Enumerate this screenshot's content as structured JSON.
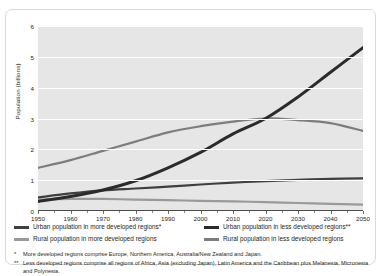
{
  "chart_data": {
    "type": "line",
    "title": "",
    "xlabel": "",
    "ylabel": "Population (billions)",
    "xlim": [
      1950,
      2050
    ],
    "ylim": [
      0,
      6
    ],
    "xticks": [
      1950,
      1960,
      1970,
      1980,
      1990,
      2000,
      2010,
      2020,
      2030,
      2040,
      2050
    ],
    "yticks": [
      0,
      1,
      2,
      3,
      4,
      5,
      6
    ],
    "grid": "horizontal",
    "legend_position": "below-plot",
    "x": [
      1950,
      1960,
      1970,
      1980,
      1990,
      2000,
      2010,
      2020,
      2030,
      2040,
      2050
    ],
    "series": [
      {
        "name": "Urban population in more developed regions*",
        "color": "#3f3f3f",
        "values": [
          0.44,
          0.57,
          0.67,
          0.73,
          0.79,
          0.86,
          0.92,
          0.97,
          1.01,
          1.04,
          1.06
        ]
      },
      {
        "name": "Urban population in less developed regions**",
        "color": "#2b2b2b",
        "values": [
          0.31,
          0.47,
          0.68,
          0.98,
          1.4,
          1.9,
          2.5,
          3.0,
          3.7,
          4.5,
          5.3
        ]
      },
      {
        "name": "Rural population in more developed regions",
        "color": "#9a9a9a",
        "values": [
          0.37,
          0.39,
          0.39,
          0.37,
          0.35,
          0.33,
          0.31,
          0.29,
          0.26,
          0.23,
          0.21
        ]
      },
      {
        "name": "Rural population in less developed regions",
        "color": "#7d7d7d",
        "values": [
          1.4,
          1.65,
          1.95,
          2.25,
          2.55,
          2.75,
          2.9,
          3.0,
          2.95,
          2.85,
          2.6
        ]
      }
    ]
  },
  "yaxis": {
    "title": "Population (billions)",
    "ticks": [
      "0",
      "1",
      "2",
      "3",
      "4",
      "5",
      "6"
    ]
  },
  "xaxis": {
    "ticks": [
      "1950",
      "1960",
      "1970",
      "1980",
      "1990",
      "2000",
      "2010",
      "2020",
      "2030",
      "2040",
      "2050"
    ]
  },
  "legend": {
    "items": [
      {
        "label": "Urban population in more developed regions*",
        "color": "#3f3f3f"
      },
      {
        "label": "Urban population in less developed regions**",
        "color": "#2b2b2b"
      },
      {
        "label": "Rural population in more developed regions",
        "color": "#9a9a9a"
      },
      {
        "label": "Rural population in less developed regions",
        "color": "#7d7d7d"
      }
    ]
  },
  "footnotes": [
    {
      "mark": "*",
      "text": "More developed regions comprise Europe, Northern America, Australia/New Zealand and Japan."
    },
    {
      "mark": "**",
      "text": "Less developed regions comprise all regions of Africa, Asia (excluding Japan), Latin America and the Caribbean plus Melanesia, Micronesia and Polynesia."
    }
  ]
}
